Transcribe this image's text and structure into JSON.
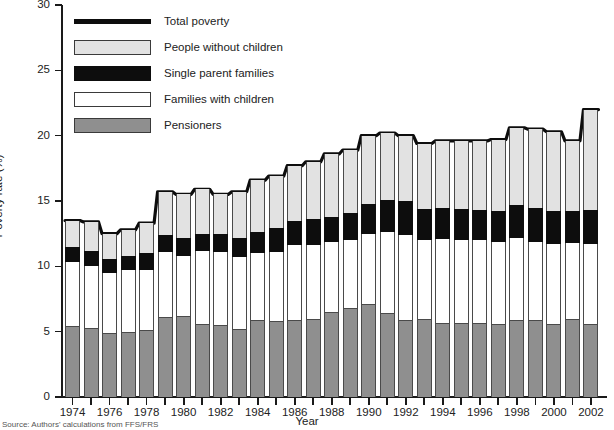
{
  "chart_data": {
    "type": "bar",
    "stacked": true,
    "title": "",
    "xlabel": "Year",
    "ylabel": "Poverty rate (%)",
    "ylim": [
      0,
      30
    ],
    "yticks": [
      0,
      5,
      10,
      15,
      20,
      25,
      30
    ],
    "grid": false,
    "legend_position": "top-left",
    "categories": [
      1974,
      1975,
      1976,
      1977,
      1978,
      1979,
      1980,
      1981,
      1982,
      1983,
      1984,
      1985,
      1986,
      1987,
      1988,
      1989,
      1990,
      1991,
      1992,
      1993,
      1994,
      1995,
      1996,
      1997,
      1998,
      1999,
      2000,
      2001,
      2002
    ],
    "xtick_labels": [
      "1974",
      "1976",
      "1978",
      "1980",
      "1982",
      "1984",
      "1986",
      "1988",
      "1990",
      "1992",
      "1994",
      "1996",
      "1998",
      "2000",
      "2002"
    ],
    "series": [
      {
        "name": "Pensioners",
        "color": "#8f8f8f",
        "values": [
          5.4,
          5.3,
          4.9,
          5.0,
          5.1,
          6.1,
          6.2,
          5.6,
          5.5,
          5.2,
          5.9,
          5.8,
          5.9,
          6.0,
          6.5,
          6.8,
          7.1,
          6.4,
          5.9,
          6.0,
          5.7,
          5.7,
          5.7,
          5.6,
          5.9,
          5.9,
          5.6,
          6.0,
          5.6
        ]
      },
      {
        "name": "Families with children",
        "color": "#ffffff",
        "values": [
          4.9,
          4.7,
          4.6,
          4.7,
          4.6,
          5.0,
          4.6,
          5.6,
          5.6,
          5.5,
          5.1,
          5.3,
          5.7,
          5.6,
          5.4,
          5.2,
          5.4,
          6.2,
          6.5,
          6.0,
          6.4,
          6.3,
          6.3,
          6.3,
          6.3,
          6.0,
          6.1,
          5.8,
          6.1
        ]
      },
      {
        "name": "Single parent families",
        "color": "#0d0d0d",
        "values": [
          1.2,
          1.2,
          1.1,
          1.1,
          1.3,
          1.3,
          1.4,
          1.3,
          1.4,
          1.5,
          1.6,
          1.8,
          1.9,
          2.0,
          1.9,
          2.1,
          2.3,
          2.5,
          2.6,
          2.4,
          2.4,
          2.4,
          2.3,
          2.3,
          2.5,
          2.6,
          2.5,
          2.4,
          2.6
        ]
      },
      {
        "name": "People without children",
        "color": "#e2e2e2",
        "values": [
          2.0,
          2.2,
          1.9,
          2.0,
          2.3,
          3.3,
          3.3,
          3.4,
          3.0,
          3.5,
          4.0,
          4.0,
          4.2,
          4.4,
          4.8,
          4.8,
          5.2,
          5.1,
          5.0,
          5.0,
          5.1,
          5.2,
          5.3,
          5.5,
          5.9,
          6.0,
          6.1,
          5.4,
          7.7
        ]
      }
    ],
    "total_line": {
      "name": "Total poverty",
      "color": "#0d0d0d",
      "values": [
        13.5,
        13.4,
        12.5,
        12.8,
        13.3,
        15.7,
        15.5,
        15.9,
        15.5,
        15.7,
        16.6,
        16.9,
        17.7,
        18.0,
        18.6,
        18.9,
        20.0,
        20.2,
        20.0,
        19.4,
        19.6,
        19.6,
        19.6,
        19.7,
        20.6,
        20.5,
        20.3,
        19.6,
        22.0
      ]
    }
  },
  "axis": {
    "ylabel": "Poverty rate (%)",
    "xlabel": "Year",
    "ytick_labels": [
      "0",
      "5",
      "10",
      "15",
      "20",
      "25",
      "30"
    ]
  },
  "legend": {
    "items": [
      {
        "label": "Total poverty",
        "swatch": "line"
      },
      {
        "label": "People without children",
        "swatch": "nokid"
      },
      {
        "label": "Single parent families",
        "swatch": "sing"
      },
      {
        "label": "Families with children",
        "swatch": "fam"
      },
      {
        "label": "Pensioners",
        "swatch": "pens"
      }
    ]
  },
  "source": {
    "text": "Source: Authors' calculations from FFS/FRS"
  },
  "colors": {
    "pensioners": "#8f8f8f",
    "families_with_children": "#ffffff",
    "single_parent_families": "#0d0d0d",
    "people_without_children": "#e2e2e2",
    "total_poverty_line": "#0d0d0d",
    "axis": "#1a1a1a"
  }
}
